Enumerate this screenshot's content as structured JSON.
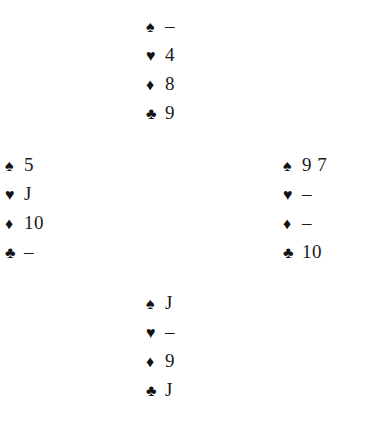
{
  "diagram": {
    "type": "bridge-deal",
    "background_color": "#ffffff",
    "text_color": "#1a1a1a",
    "void_marker": "–",
    "suit_symbols": {
      "spades": "♠",
      "hearts": "♥",
      "diamonds": "♦",
      "clubs": "♣"
    },
    "hands": {
      "north": {
        "position_label": "North",
        "suits": [
          {
            "suit": "spades",
            "symbol": "♠",
            "ranks": "–",
            "void": true
          },
          {
            "suit": "hearts",
            "symbol": "♥",
            "ranks": "4",
            "void": false
          },
          {
            "suit": "diamonds",
            "symbol": "♦",
            "ranks": "8",
            "void": false
          },
          {
            "suit": "clubs",
            "symbol": "♣",
            "ranks": "9",
            "void": false
          }
        ]
      },
      "west": {
        "position_label": "West",
        "suits": [
          {
            "suit": "spades",
            "symbol": "♠",
            "ranks": "5",
            "void": false
          },
          {
            "suit": "hearts",
            "symbol": "♥",
            "ranks": "J",
            "void": false
          },
          {
            "suit": "diamonds",
            "symbol": "♦",
            "ranks": "10",
            "void": false
          },
          {
            "suit": "clubs",
            "symbol": "♣",
            "ranks": "–",
            "void": true
          }
        ]
      },
      "east": {
        "position_label": "East",
        "suits": [
          {
            "suit": "spades",
            "symbol": "♠",
            "ranks": "9 7",
            "void": false
          },
          {
            "suit": "hearts",
            "symbol": "♥",
            "ranks": "–",
            "void": true
          },
          {
            "suit": "diamonds",
            "symbol": "♦",
            "ranks": "–",
            "void": true
          },
          {
            "suit": "clubs",
            "symbol": "♣",
            "ranks": "10",
            "void": false
          }
        ]
      },
      "south": {
        "position_label": "South",
        "suits": [
          {
            "suit": "spades",
            "symbol": "♠",
            "ranks": "J",
            "void": false
          },
          {
            "suit": "hearts",
            "symbol": "♥",
            "ranks": "–",
            "void": true
          },
          {
            "suit": "diamonds",
            "symbol": "♦",
            "ranks": "9",
            "void": false
          },
          {
            "suit": "clubs",
            "symbol": "♣",
            "ranks": "J",
            "void": false
          }
        ]
      }
    }
  }
}
